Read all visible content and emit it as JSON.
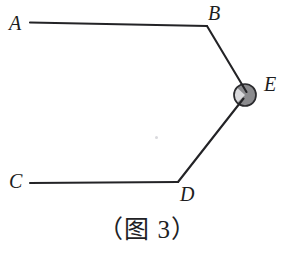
{
  "figure": {
    "caption": "（图 3）",
    "background_color": "#ffffff",
    "stroke_color": "#232326",
    "labels": {
      "a": "A",
      "b": "B",
      "c": "C",
      "d": "D",
      "e": "E"
    },
    "points": {
      "A": {
        "x": 30,
        "y": 23
      },
      "B": {
        "x": 207,
        "y": 26
      },
      "C": {
        "x": 30,
        "y": 183
      },
      "D": {
        "x": 178,
        "y": 182
      },
      "E": {
        "x": 245,
        "y": 95
      }
    },
    "segments": [
      {
        "name": "AB",
        "from": "A",
        "to": "B"
      },
      {
        "name": "BE",
        "from": "B",
        "to": "E"
      },
      {
        "name": "DE",
        "from": "D",
        "to": "E"
      },
      {
        "name": "CD",
        "from": "C",
        "to": "D"
      }
    ],
    "node_marker": {
      "at": "E",
      "radius": 11,
      "fill_dark": "#8b8b8e",
      "fill_light": "#d6d6d8",
      "outline": "#2a2a2d",
      "shape": "shaded-circle-with-light-wedge"
    }
  }
}
